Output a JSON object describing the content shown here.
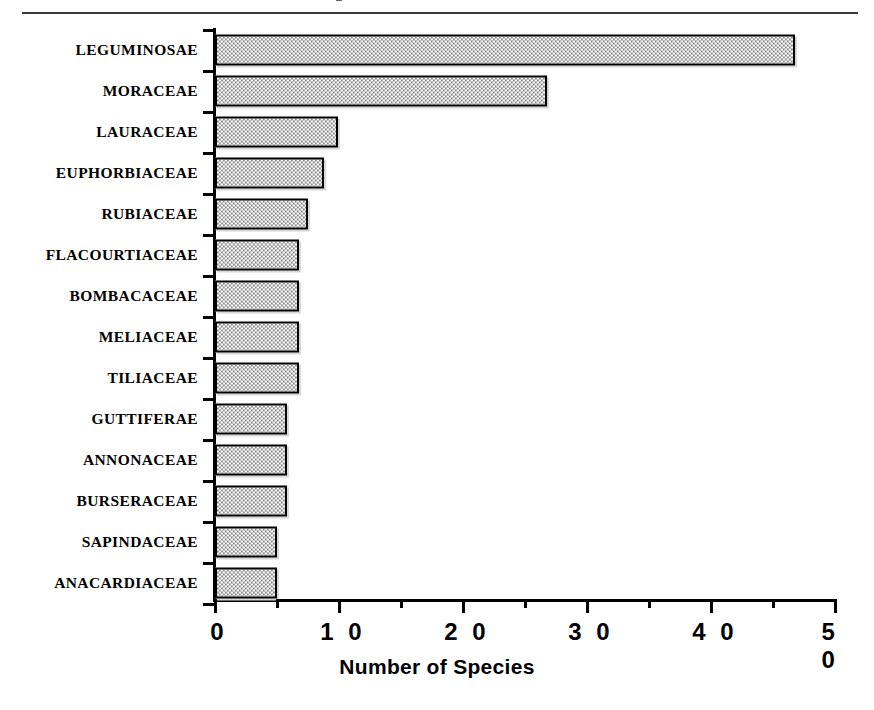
{
  "figure": {
    "top_rule": true,
    "cropped_caption_fragment": true
  },
  "chart_data": {
    "type": "bar",
    "orientation": "horizontal",
    "title": "",
    "xlabel": "Number of Species",
    "ylabel": "",
    "categories": [
      "LEGUMINOSAE",
      "MORACEAE",
      "LAURACEAE",
      "EUPHORBIACEAE",
      "RUBIACEAE",
      "FLACOURTIACEAE",
      "BOMBACACEAE",
      "MELIACEAE",
      "TILIACEAE",
      "GUTTIFERAE",
      "ANNONACEAE",
      "BURSERACEAE",
      "SAPINDACEAE",
      "ANACARDIACEAE"
    ],
    "values": [
      46.8,
      26.8,
      9.9,
      8.8,
      7.5,
      6.8,
      6.8,
      6.8,
      6.8,
      5.8,
      5.8,
      5.8,
      5.0,
      5.0
    ],
    "xlim": [
      0,
      50
    ],
    "xticks": [
      0,
      10,
      20,
      30,
      40,
      50
    ],
    "xtick_labels": [
      "0",
      "1 0",
      "2 0",
      "3 0",
      "4 0",
      "5 0"
    ],
    "xminor_ticks": [
      5,
      15,
      25,
      35,
      45
    ],
    "grid": false,
    "legend": null,
    "bar_fill": "checkerboard-dither-gray",
    "bar_fill_color": "#8a8a8a",
    "bar_edge_color": "#000000",
    "bar_shadow_color": "#d8d8d8",
    "background": "#ffffff"
  }
}
